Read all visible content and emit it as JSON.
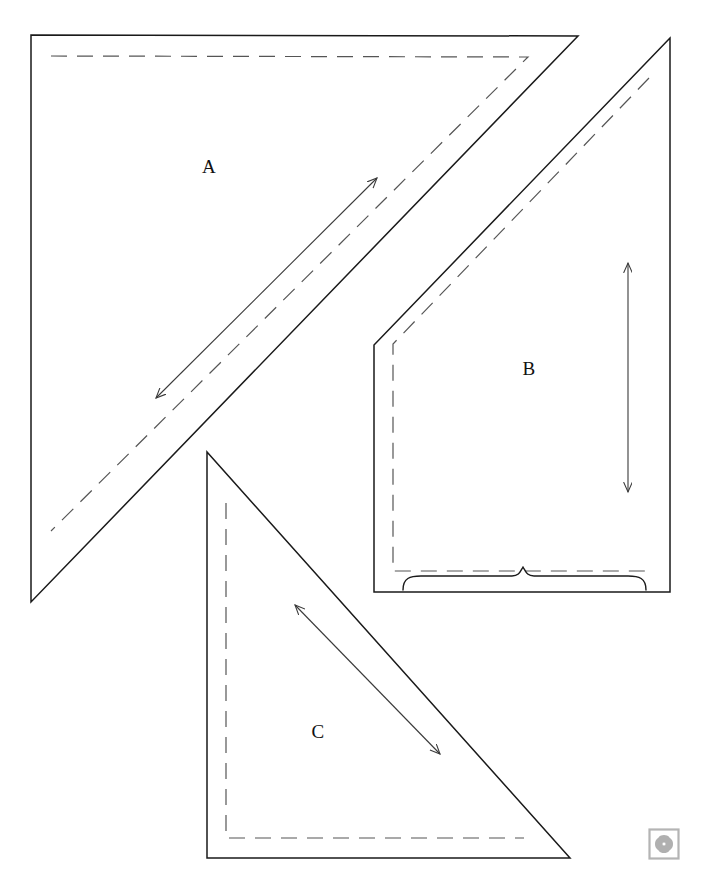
{
  "sheet": {
    "title": "Pattern Piece Layout Sheet",
    "width": 702,
    "height": 887,
    "background_color": "#ffffff",
    "cut_line_color": "#1a1a1a",
    "seam_line_color": "#555555",
    "grain_arrow_color": "#3a3a3a",
    "logo_color": "#b0b0b0"
  },
  "pieces": [
    {
      "id": "piece-a",
      "label": "A",
      "shape": "right-triangle",
      "orientation": "right-angle-top-left",
      "label_position": {
        "x": 209,
        "y": 169
      },
      "cut_outline_points": "31,35 578,36 31,602",
      "seam_outline_points": "51,56 528,57 51,531",
      "grain_line": {
        "type": "double-headed-arrow",
        "direction": "diagonal-up-right",
        "x1": 156,
        "y1": 398,
        "x2": 377,
        "y2": 178
      }
    },
    {
      "id": "piece-b",
      "label": "B",
      "shape": "right-triangle-notched",
      "orientation": "right-angle-bottom-right",
      "label_position": {
        "x": 529,
        "y": 371
      },
      "cut_outline_points": "670,38 374,345 374,592 670,592",
      "seam_outline_points": "649,78 393,344 393,571 649,571",
      "grain_line": {
        "type": "double-headed-arrow",
        "direction": "vertical",
        "x1": 628,
        "y1": 263,
        "x2": 628,
        "y2": 492
      },
      "brace": {
        "type": "curly-brace",
        "orientation": "horizontal-up",
        "x_start": 403,
        "x_end": 646,
        "y": 578,
        "peak_x": 523,
        "peak_height": 11
      }
    },
    {
      "id": "piece-c",
      "label": "C",
      "shape": "right-triangle",
      "orientation": "right-angle-bottom-left",
      "label_position": {
        "x": 318,
        "y": 734
      },
      "cut_outline_points": "207,452 207,858 570,858",
      "seam_outline_points": "226,503 226,838 524,838",
      "grain_line": {
        "type": "double-headed-arrow",
        "direction": "diagonal-down-right",
        "x1": 295,
        "y1": 605,
        "x2": 440,
        "y2": 754
      }
    }
  ],
  "watermark": {
    "name": "clover-logo",
    "x": 648,
    "y": 828,
    "size": 32,
    "petal_count": 4
  }
}
